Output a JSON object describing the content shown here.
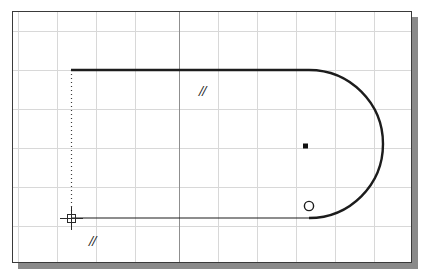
{
  "app": {
    "name": "cad-drawing-canvas",
    "background_color": "#ffffff",
    "window": {
      "border_color": "#3a3a3a",
      "shadow_color": "#8a8a8a",
      "x": 12,
      "y": 11,
      "width": 400,
      "height": 252
    }
  },
  "grid": {
    "minor_color": "#d8d8d8",
    "major_color": "#9a9a9a",
    "spacing_px": 39,
    "vertical_lines": [
      17,
      56,
      95,
      134,
      178,
      217,
      256,
      295,
      334,
      373
    ],
    "horizontal_lines": [
      30,
      69,
      108,
      147,
      186,
      225
    ],
    "major_vertical": [
      178
    ],
    "major_horizontal": []
  },
  "geometry": {
    "stroke_color": "#1c1c1c",
    "slot_shape": {
      "name": "slot-outline",
      "top_line": {
        "x1": 70,
        "y1": 69,
        "x2": 308,
        "y2": 69,
        "width": 2.2
      },
      "bottom_line": {
        "x1": 70,
        "y1": 217,
        "x2": 308,
        "y2": 217,
        "width": 1.1
      },
      "arc": {
        "center_x": 308,
        "center_y": 145,
        "radius": 74,
        "start_angle_deg": -90,
        "end_angle_deg": 90,
        "width": 2.2
      }
    },
    "tracking_line": {
      "name": "polar-tracking-line",
      "x": 70,
      "y1": 69,
      "y2": 217,
      "style": "dotted",
      "color": "#3c3c3c"
    },
    "center_point": {
      "x": 304,
      "y": 145,
      "size": 5,
      "color": "#111111"
    },
    "snap_marker": {
      "x": 308,
      "y": 205,
      "radius": 5,
      "color": "#1c1c1c",
      "shape": "circle"
    },
    "cursor": {
      "x": 70,
      "y": 217,
      "arm": 11,
      "color": "#2a2a2a"
    }
  },
  "annotations": {
    "parallel_mark_top": "//",
    "parallel_mark_bottom": "//"
  }
}
